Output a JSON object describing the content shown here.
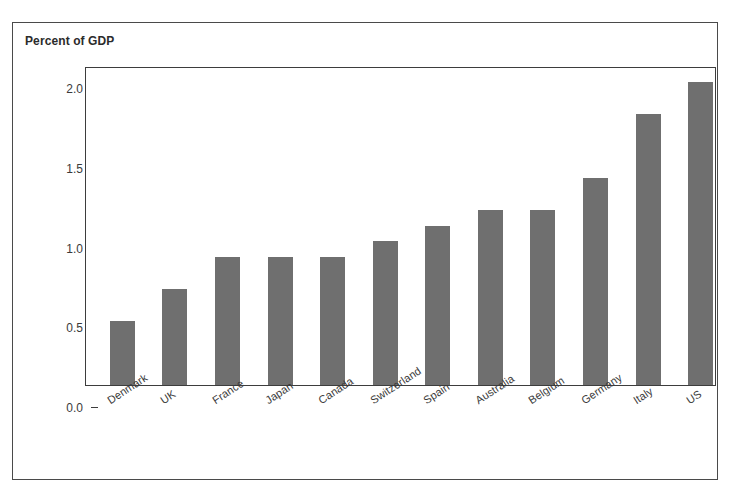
{
  "figure": {
    "axis_title": "Percent of GDP",
    "top_cut_caption": "",
    "frame_color": "#4a4a4a",
    "bar_color": "#6f6f6f",
    "text_color": "#3a3a3a"
  },
  "chart_data": {
    "type": "bar",
    "title": "Percent of GDP",
    "xlabel": "",
    "ylabel": "Percent of GDP",
    "ylim": [
      0.0,
      2.0
    ],
    "yticks": [
      "0.0",
      "0.5",
      "1.0",
      "1.5",
      "2.0"
    ],
    "ytick_values": [
      0.0,
      0.5,
      1.0,
      1.5,
      2.0
    ],
    "grid": false,
    "legend": "none",
    "categories": [
      "Denmark",
      "UK",
      "France",
      "Japan",
      "Canada",
      "Switzerland",
      "Spain",
      "Australia",
      "Belgium",
      "Germany",
      "Italy",
      "US"
    ],
    "values": [
      0.4,
      0.6,
      0.8,
      0.8,
      0.8,
      0.9,
      1.0,
      1.1,
      1.1,
      1.3,
      1.7,
      1.9
    ]
  }
}
